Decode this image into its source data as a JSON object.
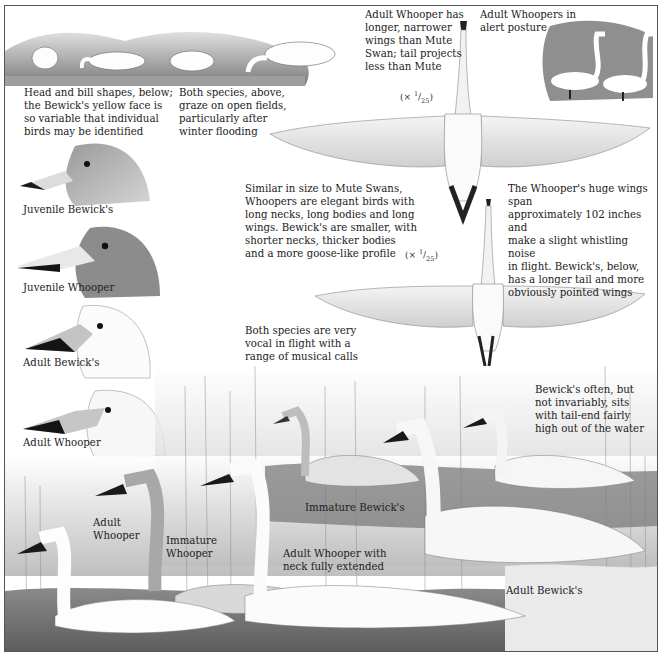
{
  "plate": {
    "subject": "Whooper Swan and Bewick's Swan identification plate",
    "panels": {
      "grazing": {
        "caption_left": "Head and bill shapes, below;\nthe Bewick's yellow face is\nso variable that individual\nbirds may be identified",
        "caption_right": "Both species, above,\ngraze on open fields,\nparticularly after\nwinter flooding"
      },
      "flight_top": {
        "caption": "Adult Whooper has\nlonger, narrower\nwings than Mute\nSwan; tail projects\nless than Mute",
        "scale_prefix": "(× ",
        "scale_num": "1",
        "scale_den": "25",
        "scale_suffix": ")"
      },
      "alert": {
        "caption": "Adult Whoopers in\nalert posture"
      },
      "size_note": {
        "caption": "Similar in size to Mute Swans,\nWhoopers are elegant birds with\nlong necks, long bodies and long\nwings. Bewick's are smaller, with\nshorter necks, thicker bodies\nand a more goose-like profile"
      },
      "flight_bottom": {
        "caption": "The Whooper's huge wings span\napproximately 102 inches and\nmake a slight whistling noise\nin flight. Bewick's, below,\nhas a longer tail and more\nobviously pointed wings",
        "scale_prefix": "(× ",
        "scale_num": "1",
        "scale_den": "25",
        "scale_suffix": ")"
      },
      "calls_note": {
        "caption": "Both species are very\nvocal in flight with a\nrange of musical calls"
      },
      "tail_note": {
        "caption": "Bewick's often, but\nnot invariably, sits\nwith tail-end fairly\nhigh out of the water"
      }
    },
    "heads": [
      {
        "label": "Juvenile Bewick's"
      },
      {
        "label": "Juvenile Whooper"
      },
      {
        "label": "Adult Bewick's"
      },
      {
        "label": "Adult Whooper"
      }
    ],
    "swimming": [
      {
        "label": "Immature Bewick's"
      },
      {
        "label": "Adult\nWhooper"
      },
      {
        "label": "Immature\nWhooper"
      },
      {
        "label": "Adult Whooper with\nneck fully extended"
      },
      {
        "label": "Adult Bewick's"
      }
    ],
    "colors": {
      "ink": "#222222",
      "frame": "#555555",
      "bill_black": "#1a1a1a",
      "face_patch": "#c9c9c9",
      "reed_grey": "#9a9a9a",
      "water": "#6e6e6e"
    }
  }
}
